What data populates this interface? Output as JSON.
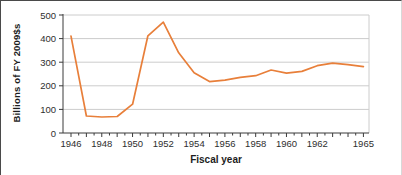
{
  "figure": {
    "y_axis_title": "Billions of FY 2009$s",
    "x_axis_title": "Fiscal year"
  },
  "chart_data": {
    "type": "line",
    "title": "",
    "xlabel": "Fiscal year",
    "ylabel": "Billions of FY 2009$s",
    "x": [
      1946,
      1947,
      1948,
      1949,
      1950,
      1951,
      1952,
      1953,
      1954,
      1955,
      1956,
      1957,
      1958,
      1959,
      1960,
      1961,
      1962,
      1963,
      1964,
      1965
    ],
    "series": [
      {
        "name": "defense-spending",
        "values": [
          410,
          72,
          68,
          70,
          122,
          412,
          470,
          340,
          255,
          218,
          224,
          236,
          243,
          267,
          254,
          261,
          285,
          296,
          290,
          281
        ]
      }
    ],
    "xlim": [
      1945.5,
      1965.4
    ],
    "ylim": [
      0,
      500
    ],
    "yticks": [
      0,
      100,
      200,
      300,
      400,
      500
    ],
    "ytick_labels": [
      "0",
      "100",
      "200",
      "300",
      "400",
      "500"
    ],
    "xticks_labeled": [
      1946,
      1948,
      1950,
      1952,
      1954,
      1956,
      1958,
      1960,
      1962,
      1965
    ],
    "xtick_labels": [
      "1946",
      "1948",
      "1950",
      "1952",
      "1954",
      "1956",
      "1958",
      "1960",
      "1962",
      "1965"
    ],
    "minor_xticks": "every half year",
    "grid": "horizontal gridlines only",
    "legend": "none",
    "line_color": "#E87F3A",
    "grid_color": "#CCCCCC",
    "axis_color": "#3A3A3A",
    "text_color": "#2E2E2E"
  }
}
